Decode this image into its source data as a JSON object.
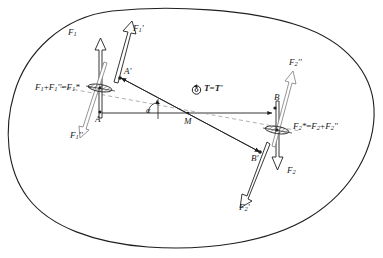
{
  "diagram": {
    "body_outline_name": "rigid-body-outline",
    "colors": {
      "stroke": "#1f1f1f",
      "thin_stroke": "#555555",
      "dashed": "#8a8a8a",
      "background": "#ffffff"
    },
    "points": [
      {
        "id": "A",
        "label": "A",
        "x": 99,
        "y": 116
      },
      {
        "id": "Ap",
        "label": "A'",
        "x": 119,
        "y": 73
      },
      {
        "id": "M",
        "label": "M",
        "x": 188,
        "y": 118
      },
      {
        "id": "B",
        "label": "B",
        "x": 276,
        "y": 99
      },
      {
        "id": "Bp",
        "label": "B'",
        "x": 255,
        "y": 155
      }
    ],
    "forces": [
      {
        "id": "F1",
        "label": "F",
        "sub": "1",
        "prime": "",
        "x": 70,
        "y": 33
      },
      {
        "id": "F1p",
        "label": "F",
        "sub": "1",
        "prime": "'",
        "x": 133,
        "y": 29
      },
      {
        "id": "F1pp",
        "label": "F",
        "sub": "1",
        "prime": "''",
        "x": 72,
        "y": 134
      },
      {
        "id": "F2",
        "label": "F",
        "sub": "2",
        "prime": "",
        "x": 292,
        "y": 170
      },
      {
        "id": "F2p",
        "label": "F",
        "sub": "2",
        "prime": "'",
        "x": 243,
        "y": 207
      },
      {
        "id": "F2pp",
        "label": "F",
        "sub": "2",
        "prime": "''",
        "x": 290,
        "y": 63
      }
    ],
    "equations": [
      {
        "id": "eq-left",
        "text": "F₁ + F₁'' = F₁*",
        "x": 36,
        "y": 84
      },
      {
        "id": "eq-right",
        "text": "F₂* = F₂ + F₂''",
        "x": 294,
        "y": 123
      }
    ],
    "equation_left": {
      "t1": "F",
      "s1": "1",
      "op1": "+",
      "t2": "F",
      "s2": "1",
      "p2": "''",
      "op2": "=",
      "t3": "F",
      "s3": "1",
      "p3": "*"
    },
    "equation_right": {
      "t1": "F",
      "s1": "2",
      "p1": "*",
      "op1": "=",
      "t2": "F",
      "s2": "2",
      "op2": "+",
      "t3": "F",
      "s3": "2",
      "p3": "''"
    },
    "couple_moment": {
      "id": "moment-T",
      "label_T": "T",
      "equals": "=",
      "label_Tp": "T'",
      "icon": "circular-arrow-icon",
      "x": 196,
      "y": 86
    },
    "angle": {
      "id": "angle-alpha",
      "label": "α",
      "x": 152,
      "y": 112
    }
  }
}
